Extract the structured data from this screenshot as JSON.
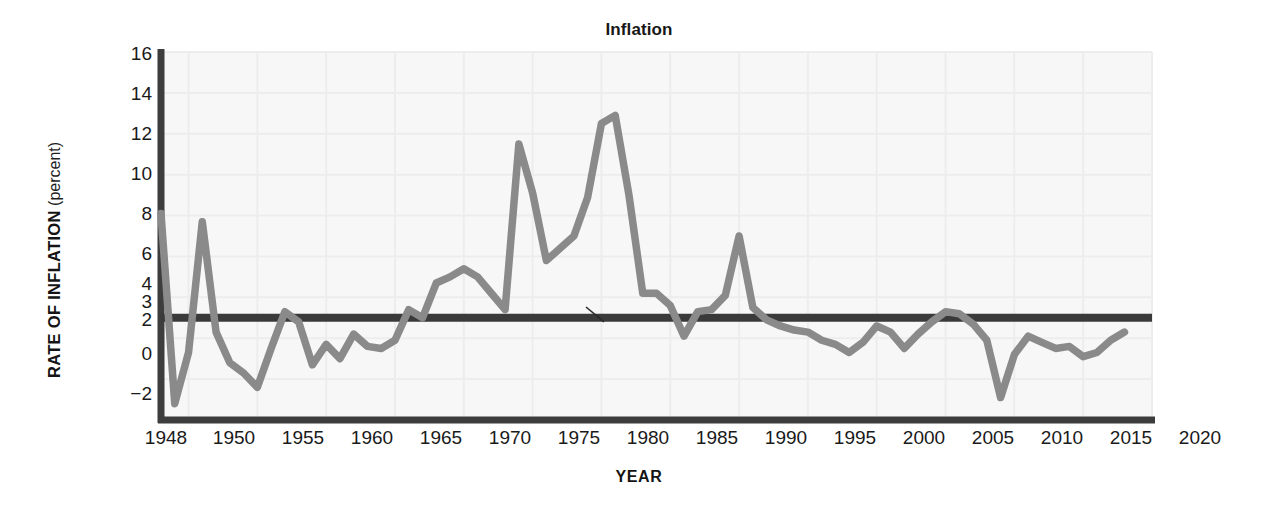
{
  "chart_data": {
    "type": "line",
    "title": "Inflation",
    "xlabel": "YEAR",
    "ylabel": "RATE OF INFLATION",
    "ylabel_sub": "(percent)",
    "xlim": [
      1948,
      2020
    ],
    "ylim": [
      -2,
      16
    ],
    "grid": true,
    "legend_position": "inline-annotations",
    "xticks": [
      1948,
      1950,
      1955,
      1960,
      1965,
      1970,
      1975,
      1980,
      1985,
      1990,
      1995,
      2000,
      2005,
      2010,
      2015,
      2020
    ],
    "yticks": [
      16,
      14,
      12,
      10,
      8,
      6,
      4,
      3,
      2,
      0,
      -2
    ],
    "annotations": [
      {
        "id": "record",
        "text": "The record",
        "x": 1971,
        "y": 10.6
      },
      {
        "id": "goal",
        "text": "The goal",
        "x": 1982,
        "y": 1.4
      }
    ],
    "colors": {
      "record_line": "#8a8a8a",
      "goal_line": "#3a3a3a",
      "axis": "#3d3d3d",
      "grid": "#ededed",
      "plot_background": "#f7f7f7",
      "text": "#1a1a1a"
    },
    "series": [
      {
        "name": "The record",
        "color": "#8a8a8a",
        "x": [
          1948,
          1949,
          1950,
          1951,
          1952,
          1953,
          1954,
          1955,
          1956,
          1957,
          1958,
          1959,
          1960,
          1961,
          1962,
          1963,
          1964,
          1965,
          1966,
          1967,
          1968,
          1969,
          1970,
          1971,
          1972,
          1973,
          1974,
          1975,
          1976,
          1977,
          1978,
          1979,
          1980,
          1981,
          1982,
          1983,
          1984,
          1985,
          1986,
          1987,
          1988,
          1989,
          1990,
          1991,
          1992,
          1993,
          1994,
          1995,
          1996,
          1997,
          1998,
          1999,
          2000,
          2001,
          2002,
          2003,
          2004,
          2005,
          2006,
          2007,
          2008,
          2009,
          2010,
          2011,
          2012,
          2013,
          2014,
          2015,
          2016,
          2017,
          2018
        ],
        "y": [
          8.1,
          -1.2,
          1.3,
          7.7,
          2.3,
          0.8,
          0.3,
          -0.4,
          1.5,
          3.3,
          2.8,
          0.7,
          1.7,
          1.0,
          2.2,
          1.6,
          1.5,
          1.9,
          3.4,
          3.0,
          4.7,
          5.0,
          5.4,
          5.0,
          4.2,
          3.4,
          11.5,
          9.1,
          5.8,
          6.4,
          7.0,
          8.9,
          12.5,
          12.9,
          9.0,
          4.2,
          4.2,
          3.6,
          2.1,
          3.3,
          3.4,
          4.1,
          7.0,
          3.5,
          2.9,
          2.6,
          2.4,
          2.3,
          1.9,
          1.7,
          1.3,
          1.8,
          2.6,
          2.3,
          1.5,
          2.2,
          2.8,
          3.3,
          3.2,
          2.7,
          1.9,
          -0.9,
          1.2,
          2.1,
          1.8,
          1.5,
          1.6,
          1.1,
          1.3,
          1.9,
          2.3
        ]
      },
      {
        "name": "The goal",
        "color": "#3a3a3a",
        "type": "hline",
        "value": 3.0
      }
    ]
  },
  "title": {
    "text": "Inflation"
  },
  "axes": {
    "y_title_main": "RATE OF INFLATION",
    "y_title_sub": "(percent)",
    "x_title": "YEAR"
  },
  "yticks": {
    "t0": "16",
    "t1": "14",
    "t2": "12",
    "t3": "10",
    "t4": "8",
    "t5": "6",
    "t6": "4",
    "t7": "3",
    "t8": "2",
    "t9": "0",
    "t10": "−2"
  },
  "xticks": {
    "t0": "1948",
    "t1": "1950",
    "t2": "1955",
    "t3": "1960",
    "t4": "1965",
    "t5": "1970",
    "t6": "1975",
    "t7": "1980",
    "t8": "1985",
    "t9": "1990",
    "t10": "1995",
    "t11": "2000",
    "t12": "2005",
    "t13": "2010",
    "t14": "2015",
    "t15": "2020"
  },
  "annotations": {
    "record": "The record",
    "goal": "The goal"
  }
}
